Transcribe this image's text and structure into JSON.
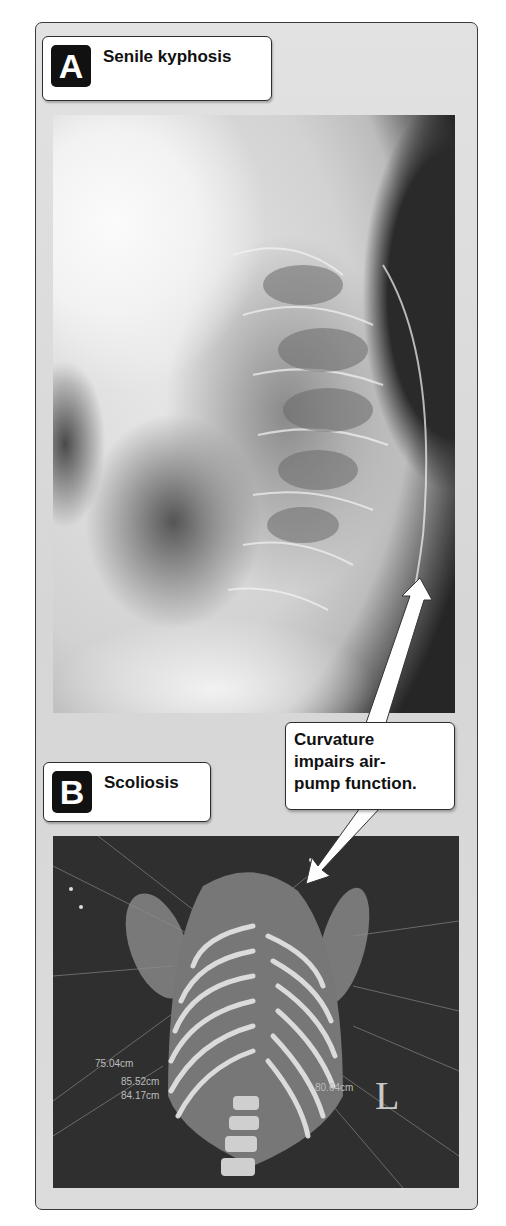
{
  "figure": {
    "panels": [
      {
        "letter": "A",
        "title": "Senile kyphosis",
        "image": "lateral-thoracic-xray"
      },
      {
        "letter": "B",
        "title": "Scoliosis",
        "image": "3d-ct-rib-cage-posterior"
      }
    ],
    "callout": {
      "lines": [
        "Curvature",
        "impairs air-",
        "pump function."
      ]
    },
    "ct_annotations": {
      "measurements": [
        "75.04cm",
        "85.52cm",
        "84.17cm",
        "80.64cm"
      ],
      "orientation_marker": "L"
    },
    "colors": {
      "frame_bg": "#dcdcdc",
      "frame_border": "#3a3a3a",
      "label_letter_bg": "#111111",
      "arrow": "#ffffff",
      "ct_bg": "#2f2f2f"
    }
  }
}
